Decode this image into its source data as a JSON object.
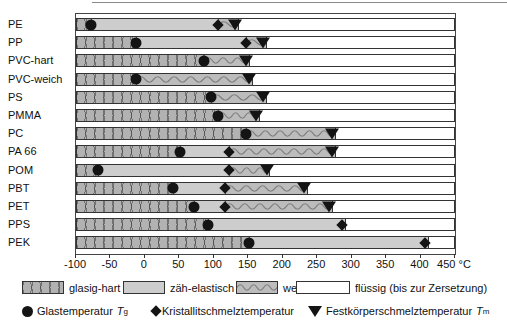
{
  "colors": {
    "glasig_hart_fill": "#b2b2b2",
    "zaeh_elastisch_fill": "#cdcdcd",
    "weich_fill": "#bcbcbc",
    "marker": "#141414",
    "bar_border": "#333333"
  },
  "chart_data": {
    "type": "bar",
    "variant": "horizontal-state-range-chart",
    "title": "",
    "unit": "°C",
    "x_axis": {
      "min": -100,
      "max": 450,
      "tick_step": 50,
      "tick_values": [
        -100,
        -50,
        0,
        50,
        100,
        150,
        200,
        250,
        300,
        350,
        400,
        450
      ],
      "tick_labels": [
        "-100",
        "-50",
        "0",
        "50",
        "100",
        "150",
        "200",
        "250",
        "300",
        "350",
        "400",
        "450 °C"
      ]
    },
    "states": [
      "glasig-hart",
      "zäh-elastisch",
      "weich",
      "flüssig (bis zur Zersetzung)"
    ],
    "rows": [
      {
        "label": "PE",
        "segments": [
          {
            "state": "glasig-hart",
            "from": -100,
            "to": -80
          },
          {
            "state": "zäh-elastisch",
            "from": -80,
            "to": 105
          },
          {
            "state": "weich",
            "from": 105,
            "to": 130
          }
        ],
        "markers": [
          {
            "type": "glastemperatur",
            "symbol": "circle",
            "temp": -80
          },
          {
            "type": "kristallitschmelztemperatur",
            "symbol": "diamond",
            "temp": 105
          },
          {
            "type": "festkoerperschmelztemperatur",
            "symbol": "triangle-down",
            "temp": 130
          }
        ]
      },
      {
        "label": "PP",
        "segments": [
          {
            "state": "glasig-hart",
            "from": -100,
            "to": -15
          },
          {
            "state": "zäh-elastisch",
            "from": -15,
            "to": 145
          },
          {
            "state": "weich",
            "from": 145,
            "to": 170
          }
        ],
        "markers": [
          {
            "type": "glastemperatur",
            "symbol": "circle",
            "temp": -15
          },
          {
            "type": "kristallitschmelztemperatur",
            "symbol": "diamond",
            "temp": 145
          },
          {
            "type": "festkoerperschmelztemperatur",
            "symbol": "triangle-down",
            "temp": 170
          }
        ]
      },
      {
        "label": "PVC-hart",
        "segments": [
          {
            "state": "glasig-hart",
            "from": -100,
            "to": 85
          },
          {
            "state": "weich",
            "from": 85,
            "to": 145
          }
        ],
        "markers": [
          {
            "type": "glastemperatur",
            "symbol": "circle",
            "temp": 85
          },
          {
            "type": "festkoerperschmelztemperatur",
            "symbol": "triangle-down",
            "temp": 145
          }
        ]
      },
      {
        "label": "PVC-weich",
        "segments": [
          {
            "state": "glasig-hart",
            "from": -100,
            "to": -15
          },
          {
            "state": "weich",
            "from": -15,
            "to": 150
          }
        ],
        "markers": [
          {
            "type": "glastemperatur",
            "symbol": "circle",
            "temp": -15
          },
          {
            "type": "festkoerperschmelztemperatur",
            "symbol": "triangle-down",
            "temp": 150
          }
        ]
      },
      {
        "label": "PS",
        "segments": [
          {
            "state": "glasig-hart",
            "from": -100,
            "to": 95
          },
          {
            "state": "weich",
            "from": 95,
            "to": 170
          }
        ],
        "markers": [
          {
            "type": "glastemperatur",
            "symbol": "circle",
            "temp": 95
          },
          {
            "type": "festkoerperschmelztemperatur",
            "symbol": "triangle-down",
            "temp": 170
          }
        ]
      },
      {
        "label": "PMMA",
        "segments": [
          {
            "state": "glasig-hart",
            "from": -100,
            "to": 105
          },
          {
            "state": "weich",
            "from": 105,
            "to": 160
          }
        ],
        "markers": [
          {
            "type": "glastemperatur",
            "symbol": "circle",
            "temp": 105
          },
          {
            "type": "festkoerperschmelztemperatur",
            "symbol": "triangle-down",
            "temp": 160
          }
        ]
      },
      {
        "label": "PC",
        "segments": [
          {
            "state": "glasig-hart",
            "from": -100,
            "to": 145
          },
          {
            "state": "weich",
            "from": 145,
            "to": 270
          }
        ],
        "markers": [
          {
            "type": "glastemperatur",
            "symbol": "circle",
            "temp": 145
          },
          {
            "type": "festkoerperschmelztemperatur",
            "symbol": "triangle-down",
            "temp": 270
          }
        ]
      },
      {
        "label": "PA 66",
        "segments": [
          {
            "state": "glasig-hart",
            "from": -100,
            "to": 50
          },
          {
            "state": "zäh-elastisch",
            "from": 50,
            "to": 120
          },
          {
            "state": "weich",
            "from": 120,
            "to": 270
          }
        ],
        "markers": [
          {
            "type": "glastemperatur",
            "symbol": "circle",
            "temp": 50
          },
          {
            "type": "kristallitschmelztemperatur",
            "symbol": "diamond",
            "temp": 120
          },
          {
            "type": "festkoerperschmelztemperatur",
            "symbol": "triangle-down",
            "temp": 270
          }
        ]
      },
      {
        "label": "POM",
        "segments": [
          {
            "state": "glasig-hart",
            "from": -100,
            "to": -70
          },
          {
            "state": "zäh-elastisch",
            "from": -70,
            "to": 120
          },
          {
            "state": "weich",
            "from": 120,
            "to": 175
          }
        ],
        "markers": [
          {
            "type": "glastemperatur",
            "symbol": "circle",
            "temp": -70
          },
          {
            "type": "kristallitschmelztemperatur",
            "symbol": "diamond",
            "temp": 120
          },
          {
            "type": "festkoerperschmelztemperatur",
            "symbol": "triangle-down",
            "temp": 175
          }
        ]
      },
      {
        "label": "PBT",
        "segments": [
          {
            "state": "glasig-hart",
            "from": -100,
            "to": 40
          },
          {
            "state": "zäh-elastisch",
            "from": 40,
            "to": 115
          },
          {
            "state": "weich",
            "from": 115,
            "to": 230
          }
        ],
        "markers": [
          {
            "type": "glastemperatur",
            "symbol": "circle",
            "temp": 40
          },
          {
            "type": "kristallitschmelztemperatur",
            "symbol": "diamond",
            "temp": 115
          },
          {
            "type": "festkoerperschmelztemperatur",
            "symbol": "triangle-down",
            "temp": 230
          }
        ]
      },
      {
        "label": "PET",
        "segments": [
          {
            "state": "glasig-hart",
            "from": -100,
            "to": 70
          },
          {
            "state": "zäh-elastisch",
            "from": 70,
            "to": 115
          },
          {
            "state": "weich",
            "from": 115,
            "to": 265
          }
        ],
        "markers": [
          {
            "type": "glastemperatur",
            "symbol": "circle",
            "temp": 70
          },
          {
            "type": "kristallitschmelztemperatur",
            "symbol": "diamond",
            "temp": 115
          },
          {
            "type": "festkoerperschmelztemperatur",
            "symbol": "triangle-down",
            "temp": 265
          }
        ]
      },
      {
        "label": "PPS",
        "segments": [
          {
            "state": "glasig-hart",
            "from": -100,
            "to": 90
          },
          {
            "state": "zäh-elastisch",
            "from": 90,
            "to": 285
          }
        ],
        "markers": [
          {
            "type": "glastemperatur",
            "symbol": "circle",
            "temp": 90
          },
          {
            "type": "kristallitschmelztemperatur",
            "symbol": "diamond",
            "temp": 285
          }
        ]
      },
      {
        "label": "PEK",
        "segments": [
          {
            "state": "glasig-hart",
            "from": -100,
            "to": 150
          },
          {
            "state": "zäh-elastisch",
            "from": 150,
            "to": 405
          }
        ],
        "markers": [
          {
            "type": "glastemperatur",
            "symbol": "circle",
            "temp": 150
          },
          {
            "type": "kristallitschmelztemperatur",
            "symbol": "diamond",
            "temp": 405
          }
        ]
      }
    ]
  },
  "legend": {
    "states": [
      {
        "label": "glasig-hart",
        "pattern": "hatch"
      },
      {
        "label": "zäh-elastisch",
        "pattern": "plain"
      },
      {
        "label": "weich",
        "pattern": "wave"
      },
      {
        "label": "flüssig (bis zur Zersetzung)",
        "pattern": "empty"
      }
    ],
    "markers": [
      {
        "symbol": "circle",
        "label": "Glastemperatur",
        "var": "T",
        "sub": "g"
      },
      {
        "symbol": "diamond",
        "label": "Kristallitschmelztemperatur",
        "var": "",
        "sub": ""
      },
      {
        "symbol": "triangle-down",
        "label": "Festkörperschmelztemperatur",
        "var": "T",
        "sub": "m"
      }
    ]
  }
}
